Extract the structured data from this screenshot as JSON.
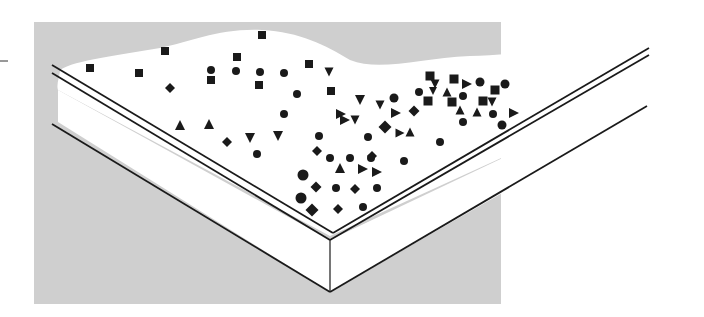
{
  "diagram": {
    "title": "",
    "colors": {
      "background_panel": "#cfcfcf",
      "surface": "#ffffff",
      "ink": "#1a1a1a",
      "page": "#ffffff"
    },
    "panel": {
      "x": 34,
      "y": 22,
      "width": 467,
      "height": 130
    },
    "shape_types": [
      "square",
      "circle",
      "diamond",
      "triangle-up",
      "triangle-down",
      "triangle-right"
    ],
    "particles": [
      {
        "shape": "square",
        "x": 90,
        "y": 68,
        "s": 8
      },
      {
        "shape": "square",
        "x": 139,
        "y": 73,
        "s": 8
      },
      {
        "shape": "square",
        "x": 165,
        "y": 51,
        "s": 8
      },
      {
        "shape": "diamond",
        "x": 170,
        "y": 88,
        "s": 8
      },
      {
        "shape": "square",
        "x": 237,
        "y": 57,
        "s": 8
      },
      {
        "shape": "square",
        "x": 262,
        "y": 35,
        "s": 8
      },
      {
        "shape": "circle",
        "x": 211,
        "y": 70,
        "s": 8
      },
      {
        "shape": "square",
        "x": 211,
        "y": 80,
        "s": 8
      },
      {
        "shape": "circle",
        "x": 236,
        "y": 71,
        "s": 8
      },
      {
        "shape": "circle",
        "x": 260,
        "y": 72,
        "s": 8
      },
      {
        "shape": "square",
        "x": 259,
        "y": 85,
        "s": 8
      },
      {
        "shape": "circle",
        "x": 284,
        "y": 73,
        "s": 8
      },
      {
        "shape": "square",
        "x": 309,
        "y": 64,
        "s": 8
      },
      {
        "shape": "circle",
        "x": 297,
        "y": 94,
        "s": 8
      },
      {
        "shape": "square",
        "x": 331,
        "y": 91,
        "s": 8
      },
      {
        "shape": "triangle-down",
        "x": 329,
        "y": 72,
        "s": 9
      },
      {
        "shape": "circle",
        "x": 284,
        "y": 114,
        "s": 8
      },
      {
        "shape": "triangle-up",
        "x": 180,
        "y": 125,
        "s": 10
      },
      {
        "shape": "triangle-up",
        "x": 209,
        "y": 124,
        "s": 10
      },
      {
        "shape": "diamond",
        "x": 227,
        "y": 142,
        "s": 8
      },
      {
        "shape": "triangle-down",
        "x": 250,
        "y": 138,
        "s": 10
      },
      {
        "shape": "triangle-down",
        "x": 278,
        "y": 136,
        "s": 10
      },
      {
        "shape": "circle",
        "x": 257,
        "y": 154,
        "s": 8
      },
      {
        "shape": "circle",
        "x": 319,
        "y": 136,
        "s": 8
      },
      {
        "shape": "diamond",
        "x": 317,
        "y": 151,
        "s": 8
      },
      {
        "shape": "circle",
        "x": 330,
        "y": 158,
        "s": 8
      },
      {
        "shape": "triangle-right",
        "x": 341,
        "y": 114,
        "s": 10
      },
      {
        "shape": "triangle-right",
        "x": 345,
        "y": 120,
        "s": 10
      },
      {
        "shape": "triangle-down",
        "x": 355,
        "y": 120,
        "s": 9
      },
      {
        "shape": "triangle-down",
        "x": 360,
        "y": 100,
        "s": 10
      },
      {
        "shape": "triangle-down",
        "x": 380,
        "y": 105,
        "s": 9
      },
      {
        "shape": "circle",
        "x": 394,
        "y": 98,
        "s": 9
      },
      {
        "shape": "triangle-right",
        "x": 396,
        "y": 113,
        "s": 10
      },
      {
        "shape": "diamond",
        "x": 385,
        "y": 127,
        "s": 11
      },
      {
        "shape": "triangle-right",
        "x": 400,
        "y": 133,
        "s": 9
      },
      {
        "shape": "triangle-up",
        "x": 410,
        "y": 132,
        "s": 9
      },
      {
        "shape": "diamond",
        "x": 414,
        "y": 111,
        "s": 9
      },
      {
        "shape": "circle",
        "x": 368,
        "y": 137,
        "s": 8
      },
      {
        "shape": "circle",
        "x": 350,
        "y": 158,
        "s": 8
      },
      {
        "shape": "circle",
        "x": 371,
        "y": 158,
        "s": 8
      },
      {
        "shape": "diamond",
        "x": 372,
        "y": 156,
        "s": 8
      },
      {
        "shape": "triangle-up",
        "x": 340,
        "y": 168,
        "s": 10
      },
      {
        "shape": "triangle-right",
        "x": 363,
        "y": 169,
        "s": 10
      },
      {
        "shape": "triangle-right",
        "x": 377,
        "y": 172,
        "s": 10
      },
      {
        "shape": "circle",
        "x": 404,
        "y": 161,
        "s": 8
      },
      {
        "shape": "circle",
        "x": 440,
        "y": 142,
        "s": 8
      },
      {
        "shape": "circle",
        "x": 303,
        "y": 175,
        "s": 11
      },
      {
        "shape": "diamond",
        "x": 316,
        "y": 187,
        "s": 9
      },
      {
        "shape": "circle",
        "x": 336,
        "y": 188,
        "s": 8
      },
      {
        "shape": "diamond",
        "x": 355,
        "y": 189,
        "s": 8
      },
      {
        "shape": "circle",
        "x": 377,
        "y": 188,
        "s": 8
      },
      {
        "shape": "circle",
        "x": 301,
        "y": 198,
        "s": 11
      },
      {
        "shape": "diamond",
        "x": 312,
        "y": 210,
        "s": 11
      },
      {
        "shape": "diamond",
        "x": 338,
        "y": 209,
        "s": 8
      },
      {
        "shape": "circle",
        "x": 363,
        "y": 207,
        "s": 8
      },
      {
        "shape": "square",
        "x": 430,
        "y": 76,
        "s": 9
      },
      {
        "shape": "triangle-down",
        "x": 435,
        "y": 84,
        "s": 9
      },
      {
        "shape": "triangle-down",
        "x": 433,
        "y": 91,
        "s": 8
      },
      {
        "shape": "square",
        "x": 454,
        "y": 79,
        "s": 9
      },
      {
        "shape": "triangle-right",
        "x": 467,
        "y": 84,
        "s": 10
      },
      {
        "shape": "circle",
        "x": 480,
        "y": 82,
        "s": 9
      },
      {
        "shape": "circle",
        "x": 505,
        "y": 84,
        "s": 9
      },
      {
        "shape": "circle",
        "x": 419,
        "y": 92,
        "s": 8
      },
      {
        "shape": "triangle-up",
        "x": 447,
        "y": 92,
        "s": 9
      },
      {
        "shape": "circle",
        "x": 463,
        "y": 96,
        "s": 8
      },
      {
        "shape": "square",
        "x": 495,
        "y": 90,
        "s": 9
      },
      {
        "shape": "square",
        "x": 428,
        "y": 101,
        "s": 9
      },
      {
        "shape": "square",
        "x": 452,
        "y": 102,
        "s": 9
      },
      {
        "shape": "triangle-up",
        "x": 460,
        "y": 110,
        "s": 9
      },
      {
        "shape": "square",
        "x": 483,
        "y": 101,
        "s": 9
      },
      {
        "shape": "triangle-down",
        "x": 492,
        "y": 102,
        "s": 9
      },
      {
        "shape": "triangle-up",
        "x": 477,
        "y": 112,
        "s": 9
      },
      {
        "shape": "circle",
        "x": 493,
        "y": 114,
        "s": 8
      },
      {
        "shape": "triangle-right",
        "x": 514,
        "y": 113,
        "s": 10
      },
      {
        "shape": "circle",
        "x": 463,
        "y": 122,
        "s": 8
      },
      {
        "shape": "circle",
        "x": 502,
        "y": 125,
        "s": 9
      }
    ]
  }
}
